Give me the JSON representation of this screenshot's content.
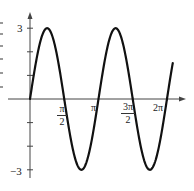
{
  "chart_data": {
    "type": "line",
    "title": "",
    "function": "y = 3 sin(2x)",
    "xlabel": "",
    "ylabel": "",
    "xlim": [
      0,
      6.5
    ],
    "ylim": [
      -3.3,
      3.6
    ],
    "grid": false,
    "legend": null,
    "x_ticks": [
      {
        "value": 1.5708,
        "label_num": "π",
        "label_den": "2"
      },
      {
        "value": 3.1416,
        "label": "π"
      },
      {
        "value": 4.7124,
        "label_num": "3π",
        "label_den": "2"
      },
      {
        "value": 6.2832,
        "label": "2π"
      }
    ],
    "y_ticks": [
      {
        "value": 3,
        "label": "3"
      },
      {
        "value": 2,
        "label": ""
      },
      {
        "value": 1,
        "label": ""
      },
      {
        "value": -1,
        "label": ""
      },
      {
        "value": -2,
        "label": ""
      },
      {
        "value": -3,
        "label": "−3"
      }
    ],
    "series": [
      {
        "name": "3 sin 2x",
        "color": "#111111",
        "x": [
          0,
          0.3927,
          0.7854,
          1.1781,
          1.5708,
          1.9635,
          2.3562,
          2.7489,
          3.1416,
          3.5343,
          3.927,
          4.3197,
          4.7124,
          5.1051,
          5.4978,
          5.8905,
          6.2832
        ],
        "y": [
          0,
          2.12,
          3,
          2.12,
          0,
          -2.12,
          -3,
          -2.12,
          0,
          2.12,
          3,
          2.12,
          0,
          -2.12,
          -3,
          -2.12,
          0
        ]
      }
    ]
  },
  "labels": {
    "y_max": "3",
    "y_min": "−3",
    "pi_half_num": "π",
    "pi_half_den": "2",
    "pi": "π",
    "three_pi_half_num": "3π",
    "three_pi_half_den": "2",
    "two_pi": "2π"
  }
}
